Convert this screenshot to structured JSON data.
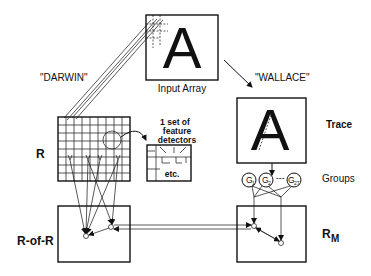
{
  "labels": {
    "input_array": "Input Array",
    "input_letter": "A",
    "darwin": "\"DARWIN\"",
    "wallace": "\"WALLACE\"",
    "trace": "Trace",
    "trace_letter": "A",
    "r": "R",
    "feature_detectors_line1": "1 set of",
    "feature_detectors_line2": "feature",
    "feature_detectors_line3": "detectors",
    "etc": "etc.",
    "groups": "Groups",
    "r_of_r": "R-of-R",
    "r_m_main": "R",
    "r_m_sub": "M"
  },
  "groups": [
    {
      "main": "G",
      "sub": "1"
    },
    {
      "main": "G",
      "sub": "2"
    },
    {
      "main": "G",
      "sub": "27"
    }
  ],
  "groups_ellipsis": "---"
}
